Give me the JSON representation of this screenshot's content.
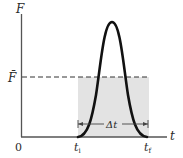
{
  "diagram": {
    "type": "force-time impulse graph",
    "axes": {
      "y_label": "F",
      "x_label": "t",
      "origin_label": "0"
    },
    "average_force": {
      "label": "F̄",
      "line_style": "dashed"
    },
    "time_markers": {
      "start_label": "t",
      "start_sub": "i",
      "end_label": "t",
      "end_sub": "f"
    },
    "interval": {
      "label": "Δt"
    },
    "colors": {
      "axis": "#555555",
      "curve": "#111111",
      "shaded_region": "#e3e3e3",
      "dashed_line": "#333333"
    }
  }
}
